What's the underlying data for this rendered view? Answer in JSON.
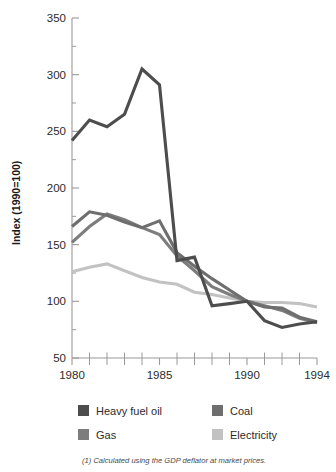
{
  "chart_data": {
    "type": "line",
    "title": "",
    "xlabel": "",
    "ylabel": "Index (1990=100)",
    "xlim": [
      1980,
      1994
    ],
    "ylim": [
      50,
      350
    ],
    "ytick_labels": [
      "50",
      "100",
      "150",
      "200",
      "250",
      "300",
      "350"
    ],
    "yticks": [
      50,
      100,
      150,
      200,
      250,
      300,
      350
    ],
    "y_minor_step": 25,
    "xtick_labels": [
      "1980",
      "1985",
      "1990",
      "1994"
    ],
    "xticks_labeled": [
      1980,
      1985,
      1990,
      1994
    ],
    "xticks_all": [
      1980,
      1981,
      1982,
      1983,
      1984,
      1985,
      1986,
      1987,
      1988,
      1989,
      1990,
      1991,
      1992,
      1993,
      1994
    ],
    "grid": false,
    "legend_position": "below",
    "x": [
      1980,
      1981,
      1982,
      1983,
      1984,
      1985,
      1986,
      1987,
      1988,
      1989,
      1990,
      1991,
      1992,
      1993,
      1994
    ],
    "series": [
      {
        "name": "Heavy fuel oil",
        "color": "#4d4d4d",
        "values": [
          242,
          260,
          254,
          265,
          305,
          291,
          136,
          139,
          96,
          98,
          100,
          83,
          77,
          80,
          82
        ]
      },
      {
        "name": "Coal",
        "color": "#6e6e6e",
        "values": [
          166,
          179,
          176,
          170,
          165,
          171,
          143,
          131,
          120,
          110,
          100,
          95,
          94,
          86,
          82
        ]
      },
      {
        "name": "Gas",
        "color": "#7d7d7d",
        "values": [
          152,
          166,
          177,
          172,
          165,
          159,
          140,
          127,
          113,
          106,
          100,
          96,
          92,
          85,
          81
        ]
      },
      {
        "name": "Electricity",
        "color": "#c2c2c2",
        "values": [
          126,
          130,
          133,
          127,
          121,
          117,
          115,
          108,
          106,
          103,
          100,
          99,
          99,
          98,
          95
        ]
      }
    ]
  },
  "legend": {
    "entries": [
      {
        "label": "Heavy fuel oil",
        "color": "#4d4d4d"
      },
      {
        "label": "Coal",
        "color": "#6e6e6e"
      },
      {
        "label": "Gas",
        "color": "#7d7d7d"
      },
      {
        "label": "Electricity",
        "color": "#c2c2c2"
      }
    ]
  },
  "footnote": {
    "text": "(1) Calculated using the GDP deflator at market prices."
  }
}
